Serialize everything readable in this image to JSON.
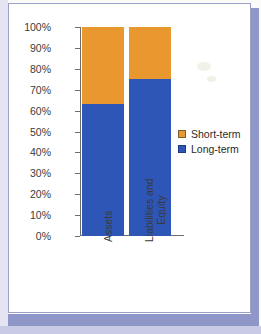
{
  "chart_data": {
    "type": "bar",
    "subtype": "stacked-column-100",
    "title": "",
    "xlabel": "",
    "ylabel": "",
    "categories": [
      "Assets",
      "Liabilities and Equity"
    ],
    "category_lines": [
      [
        "Assets"
      ],
      [
        "Liabilities and",
        "Equity"
      ]
    ],
    "series": [
      {
        "name": "Long-term",
        "color": "#2d56b7",
        "values": [
          63,
          75
        ]
      },
      {
        "name": "Short-term",
        "color": "#e8982f",
        "values": [
          37,
          25
        ]
      }
    ],
    "stack_order_bottom_to_top": [
      "Long-term",
      "Short-term"
    ],
    "ylim": [
      0,
      100
    ],
    "ytick_values": [
      0,
      10,
      20,
      30,
      40,
      50,
      60,
      70,
      80,
      90,
      100
    ],
    "ytick_labels": [
      "0%",
      "10%",
      "20%",
      "30%",
      "40%",
      "50%",
      "60%",
      "70%",
      "80%",
      "90%",
      "100%"
    ],
    "grid": false,
    "legend_position": "right",
    "legend_entries": [
      {
        "label": "Short-term",
        "color": "#e8982f"
      },
      {
        "label": "Long-term",
        "color": "#2d56b7"
      }
    ]
  },
  "colors": {
    "short_term": "#e8982f",
    "long_term": "#2d56b7",
    "axis": "#6c6c6c",
    "text": "#3a3a3a",
    "frame_border": "#9aa0c9",
    "page_shadow": "#8f96c8",
    "plot_background": "#ffffff"
  }
}
